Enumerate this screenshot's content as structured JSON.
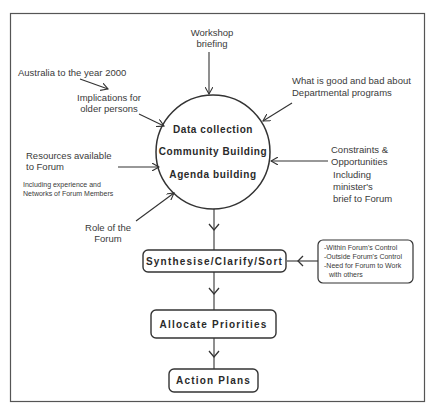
{
  "diagram": {
    "center": {
      "lines": [
        "Data collection",
        "Community Building",
        "Agenda building"
      ]
    },
    "inputs": {
      "workshop": [
        "Workshop",
        "briefing"
      ],
      "australia": [
        "Australia to the year 2000"
      ],
      "implications": [
        "Implications for",
        "older persons"
      ],
      "departmental": [
        "What is good and bad about",
        "Departmental programs"
      ],
      "resources": [
        "Resources available",
        "to Forum"
      ],
      "resources_note": [
        "Including experience and",
        "Networks of Forum Members"
      ],
      "role": [
        "Role of the",
        "Forum"
      ],
      "constraints": [
        "Constraints &",
        "Opportunities"
      ],
      "constraints_note": [
        "Including",
        "minister's",
        "brief to Forum"
      ]
    },
    "steps": [
      {
        "label": "Synthesise/Clarify/Sort"
      },
      {
        "label": "Allocate Priorities"
      },
      {
        "label": "Action Plans"
      }
    ],
    "side_box": {
      "lines": [
        "-Within Forum's Control",
        "-Outside Forum's Control",
        "-Need for Forum to Work",
        "with others"
      ]
    },
    "colors": {
      "line": "#333333",
      "text": "#3a3a3a",
      "background": "#ffffff"
    }
  }
}
